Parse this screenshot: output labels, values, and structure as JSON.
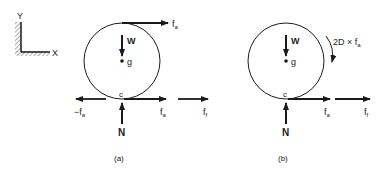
{
  "axes": {
    "y_label": "Y",
    "x_label": "X"
  },
  "panel_a": {
    "caption": "(a)",
    "weight": "W",
    "center": "g",
    "contact": "c",
    "normal": "N",
    "top_force": {
      "base": "f",
      "sub": "a"
    },
    "left_force": {
      "base": "−f",
      "sub": "a"
    },
    "right_force": {
      "base": "f",
      "sub": "a"
    },
    "far_force": {
      "base": "f",
      "sub": "f"
    }
  },
  "panel_b": {
    "caption": "(b)",
    "weight": "W",
    "center": "g",
    "contact": "c",
    "normal": "N",
    "moment": {
      "base": "2D × f",
      "sub": "a"
    },
    "right_force": {
      "base": "f",
      "sub": "a"
    },
    "far_force": {
      "base": "f",
      "sub": "f"
    }
  },
  "colors": {
    "line": "#1a1a1a",
    "hatch": "#555555"
  }
}
